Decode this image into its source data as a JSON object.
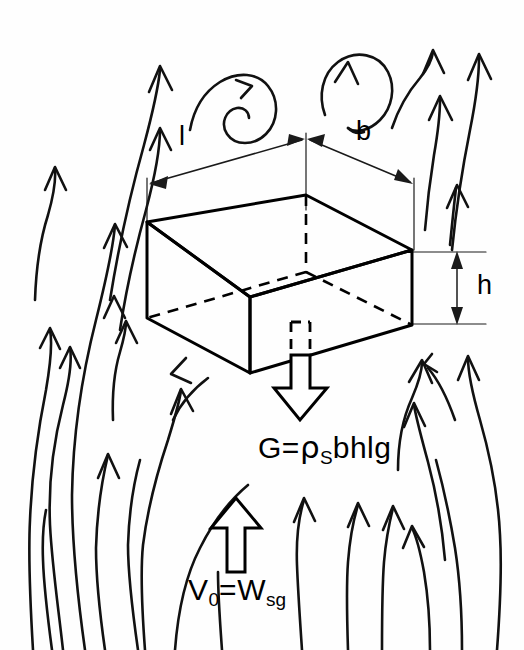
{
  "figure": {
    "kind": "hand-drawn-engineering-sketch",
    "width": 524,
    "height": 650,
    "ink_color": "#000000",
    "background_color": "#ffffff"
  },
  "dimensions": {
    "length_label": "l",
    "width_label": "b",
    "height_label": "h"
  },
  "formulas": {
    "weight": {
      "lhs": "G",
      "equals": "=",
      "rho": "ρ",
      "rho_subscript": "S",
      "rhs_terms": "bhlg",
      "full_text": "G= ρS bhlg"
    },
    "buoyancy": {
      "lhs": "V",
      "lhs_subscript": "0",
      "equals": "=",
      "rhs": "W",
      "rhs_subscript": "sg",
      "full_text": "V0 = Wsg"
    }
  },
  "arrows": {
    "weight_arrow_name": "downward-block-arrow",
    "buoyancy_arrow_name": "upward-block-arrow"
  },
  "flow_field": {
    "description": "Upward streamlines with arrowheads surrounding the block",
    "vortex_count": 2,
    "streamline_count": 20
  }
}
